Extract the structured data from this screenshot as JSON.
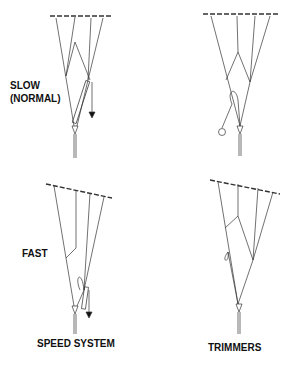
{
  "labels": {
    "slow": "SLOW",
    "slow_sub": "(NORMAL)",
    "fast": "FAST",
    "speed_system": "SPEED SYSTEM",
    "trimmers": "TRIMMERS"
  },
  "colors": {
    "line": "#333333",
    "text": "#111111",
    "background": "#ffffff"
  }
}
